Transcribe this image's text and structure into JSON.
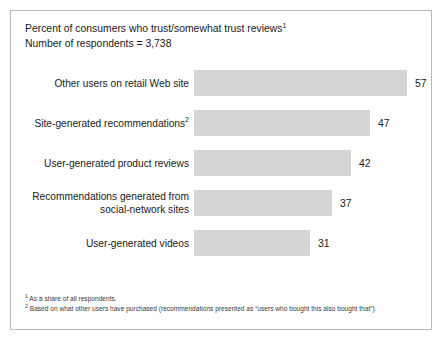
{
  "chart_data": {
    "type": "bar",
    "orientation": "horizontal",
    "title": "Percent of consumers who trust/somewhat trust reviews",
    "title_superscript": "1",
    "subtitle": "Number of respondents = 3,738",
    "categories": [
      "Other users on retail Web site",
      "Site-generated recommendations",
      "User-generated product reviews",
      "Recommendations generated from social-network sites",
      "User-generated videos"
    ],
    "category_superscripts": [
      "",
      "2",
      "",
      "",
      ""
    ],
    "values": [
      57,
      47,
      42,
      37,
      31
    ],
    "xlabel": "",
    "ylabel": "",
    "xlim": [
      0,
      64
    ],
    "grid": false,
    "legend": "none",
    "bar_color": "#d5d5d5",
    "footnotes": [
      {
        "marker": "1",
        "text": "As a share of all respondents."
      },
      {
        "marker": "2",
        "text": "Based on what other users have purchased (recommendations presented as “users who bought this also bought that”)."
      }
    ]
  }
}
